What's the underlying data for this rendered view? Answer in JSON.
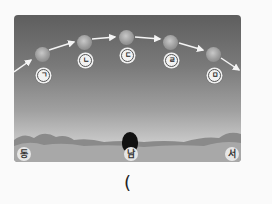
{
  "figure": {
    "sun_positions": [
      {
        "label": "ㄱ",
        "x": 28,
        "y": 38
      },
      {
        "label": "ㄴ",
        "x": 70,
        "y": 26
      },
      {
        "label": "ㄷ",
        "x": 112,
        "y": 22
      },
      {
        "label": "ㄹ",
        "x": 156,
        "y": 26
      },
      {
        "label": "ㅁ",
        "x": 199,
        "y": 39
      }
    ],
    "directions": {
      "east": "동",
      "south": "남",
      "west": "서"
    },
    "answer_blank": "("
  }
}
